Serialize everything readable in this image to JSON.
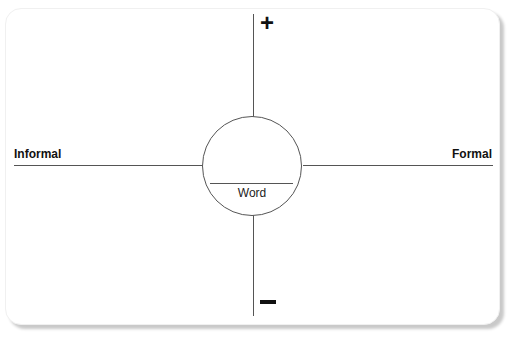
{
  "diagram": {
    "type": "word-formality-axis",
    "axes": {
      "horizontal": {
        "left_label": "Informal",
        "right_label": "Formal"
      },
      "vertical": {
        "top_symbol": "+",
        "bottom_symbol": "−"
      }
    },
    "center": {
      "label": "Word"
    }
  },
  "colors": {
    "line": "#555555",
    "text": "#111111",
    "card_bg": "#ffffff",
    "shadow": "#c9c9c9"
  }
}
